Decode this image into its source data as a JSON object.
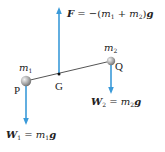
{
  "diagram": {
    "type": "free-body diagram",
    "colors": {
      "arrow": "#3a9ad9",
      "rod": "#555555",
      "ball": "#a8a8a8",
      "text": "#222222"
    },
    "points": {
      "P": {
        "label": "P",
        "mass_label": "m",
        "mass_sub": "1"
      },
      "Q": {
        "label": "Q",
        "mass_label": "m",
        "mass_sub": "2"
      },
      "G": {
        "label": "G"
      }
    },
    "forces": {
      "F": {
        "symbol": "F",
        "eq_text": " = −(",
        "m1": "m",
        "m1_sub": "1",
        "plus": " + ",
        "m2": "m",
        "m2_sub": "2",
        "close": ")",
        "g": "g",
        "direction": "up"
      },
      "W1": {
        "symbol": "W",
        "sub": "1",
        "eq_text": " = ",
        "m": "m",
        "m_sub": "1",
        "g": "g",
        "direction": "down"
      },
      "W2": {
        "symbol": "W",
        "sub": "2",
        "eq_text": " = ",
        "m": "m",
        "m_sub": "2",
        "g": "g",
        "direction": "down"
      }
    }
  }
}
